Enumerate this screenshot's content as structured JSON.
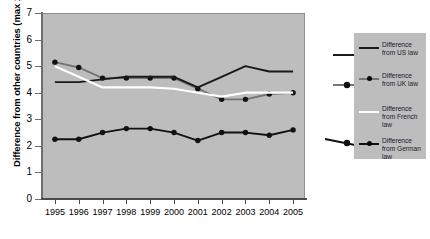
{
  "chart_data": {
    "type": "line",
    "title": "",
    "xlabel": "",
    "ylabel": "Difference from other countries (max 10)",
    "x": [
      1995,
      1996,
      1997,
      1998,
      1999,
      2000,
      2001,
      2002,
      2003,
      2004,
      2005
    ],
    "xticklabels": [
      "1995",
      "1996",
      "1997",
      "1998",
      "1999",
      "2000",
      "2001",
      "2002",
      "2003",
      "2004",
      "2005"
    ],
    "yticklabels": [
      "0",
      "1",
      "2",
      "3",
      "4",
      "5",
      "6",
      "7"
    ],
    "ylim": [
      0,
      7
    ],
    "ytick_step": 1,
    "grid": false,
    "legend_position": "right",
    "plot_background": "#bdbdbd",
    "series": [
      {
        "name": "Difference from US law",
        "color": "#1a1a1a",
        "markers": false,
        "values": [
          4.4,
          4.4,
          4.5,
          4.6,
          4.6,
          4.6,
          4.2,
          4.6,
          5.0,
          4.8,
          4.8
        ]
      },
      {
        "name": "Difference from UK law",
        "color": "#757575",
        "markers": true,
        "values": [
          5.15,
          4.95,
          4.55,
          4.55,
          4.55,
          4.55,
          4.15,
          3.75,
          3.75,
          3.95,
          4.0
        ]
      },
      {
        "name": "Difference from French law",
        "color": "#ffffff",
        "markers": false,
        "values": [
          5.0,
          4.6,
          4.2,
          4.2,
          4.2,
          4.15,
          4.0,
          3.85,
          4.0,
          4.0,
          4.0
        ]
      },
      {
        "name": "Difference from German law",
        "color": "#111111",
        "markers": true,
        "values": [
          2.25,
          2.25,
          2.5,
          2.65,
          2.65,
          2.5,
          2.2,
          2.5,
          2.5,
          2.4,
          2.6
        ]
      }
    ]
  },
  "legend": {
    "entries": [
      {
        "label": "Difference from US law",
        "swatch": "line-plain-dark",
        "color": "#1a1a1a"
      },
      {
        "label": "Difference from UK law",
        "swatch": "line-marker-gray",
        "color": "#757575"
      },
      {
        "label": "Difference from French law",
        "swatch": "line-plain-white",
        "color": "#ffffff"
      },
      {
        "label": "Difference from German law",
        "swatch": "line-marker-dark",
        "color": "#111111"
      }
    ]
  }
}
